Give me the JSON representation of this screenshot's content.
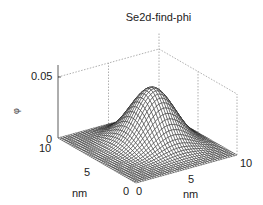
{
  "chart_data": {
    "type": "surface3d",
    "title": "Se2d-find-phi",
    "xlabel": "nm",
    "ylabel": "nm",
    "zlabel": "φ",
    "xlim": [
      0,
      10
    ],
    "ylim": [
      0,
      10
    ],
    "zlim": [
      0,
      0.05
    ],
    "x_ticks": [
      "0",
      "5",
      "10"
    ],
    "y_ticks": [
      "0",
      "5",
      "10"
    ],
    "z_ticks": [
      "0",
      "0.05"
    ],
    "grid": true,
    "surface": {
      "description": "single smooth bump (Gaussian-like) over 10x10 nm domain, near zero at edges",
      "peak_z": 0.045,
      "peak_center_nm": [
        6.5,
        6.0
      ],
      "spread_nm": 2.2,
      "mesh_lines": 40
    },
    "colors": {
      "mesh": "#1a1a1a",
      "face": "#ffffff",
      "grid": "#9a9a9a",
      "axis": "#333333"
    }
  },
  "labels": {
    "title": "Se2d-find-phi",
    "z_tick_top": "0.05",
    "z_tick_zero": "0",
    "y_tick_10": "10",
    "y_tick_5": "5",
    "y_tick_0": "0",
    "x_tick_0": "0",
    "x_tick_5": "5",
    "x_tick_10": "10",
    "x_axis_label": "nm",
    "y_axis_label": "nm",
    "z_axis_label": "φ"
  }
}
